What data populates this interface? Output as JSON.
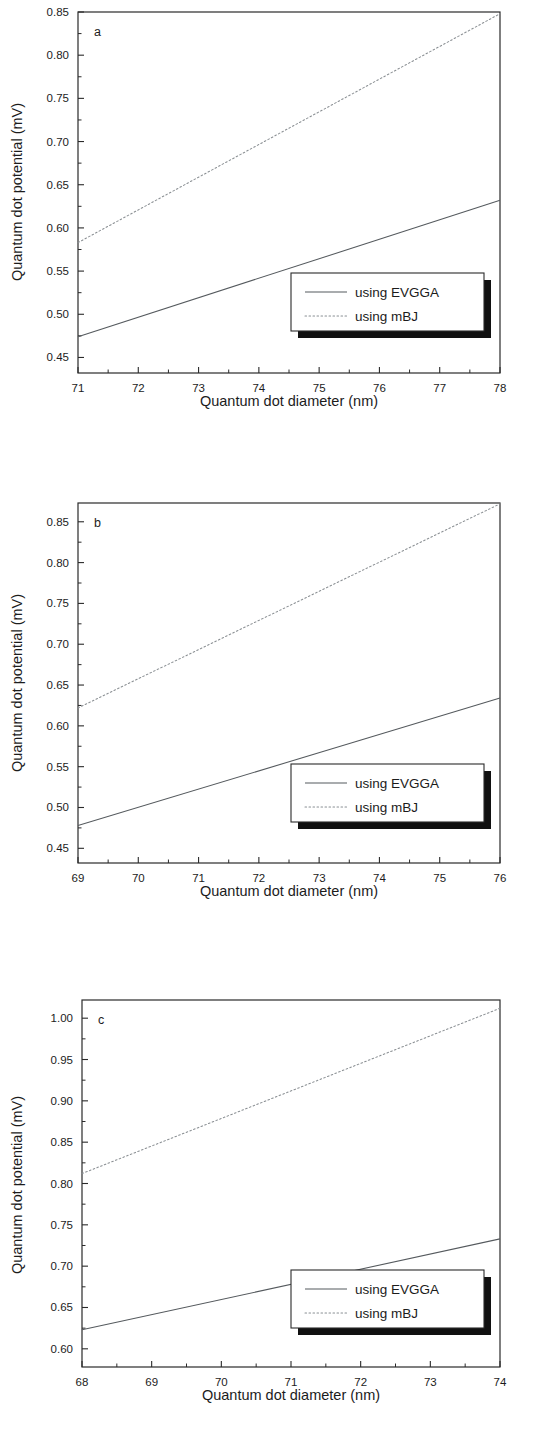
{
  "figure": {
    "panels": [
      "a",
      "b",
      "c"
    ],
    "shared_xlabel": "Quantum dot diameter (nm)",
    "shared_ylabel": "Quantum dot potential (mV)",
    "legend_entries": [
      "using EVGGA",
      "using mBJ"
    ]
  },
  "chart_data": [
    {
      "type": "line",
      "panel_label": "a",
      "title": "",
      "xlabel": "Quantum dot diameter (nm)",
      "ylabel": "Quantum dot potential (mV)",
      "xlim": [
        71,
        78
      ],
      "ylim": [
        0.432,
        0.85
      ],
      "xticks": [
        71,
        72,
        73,
        74,
        75,
        76,
        77,
        78
      ],
      "xtick_labels": [
        "71",
        "72",
        "73",
        "74",
        "75",
        "76",
        "77",
        "78"
      ],
      "yticks": [
        0.45,
        0.5,
        0.55,
        0.6,
        0.65,
        0.7,
        0.75,
        0.8,
        0.85
      ],
      "ytick_labels": [
        "0.45",
        "0.50",
        "0.55",
        "0.60",
        "0.65",
        "0.70",
        "0.75",
        "0.80",
        "0.85"
      ],
      "grid": false,
      "legend_position": "lower right",
      "series": [
        {
          "name": "using EVGGA",
          "style": "solid",
          "color": "#555a5e",
          "x": [
            71,
            78
          ],
          "values": [
            0.474,
            0.632
          ]
        },
        {
          "name": "using mBJ",
          "style": "dotted",
          "color": "#8a8f93",
          "x": [
            71,
            78
          ],
          "values": [
            0.583,
            0.848
          ]
        }
      ]
    },
    {
      "type": "line",
      "panel_label": "b",
      "title": "",
      "xlabel": "Quantum dot diameter (nm)",
      "ylabel": "Quantum dot potential (mV)",
      "xlim": [
        69,
        76
      ],
      "ylim": [
        0.432,
        0.873
      ],
      "xticks": [
        69,
        70,
        71,
        72,
        73,
        74,
        75,
        76
      ],
      "xtick_labels": [
        "69",
        "70",
        "71",
        "72",
        "73",
        "74",
        "75",
        "76"
      ],
      "yticks": [
        0.45,
        0.5,
        0.55,
        0.6,
        0.65,
        0.7,
        0.75,
        0.8,
        0.85
      ],
      "ytick_labels": [
        "0.45",
        "0.50",
        "0.55",
        "0.60",
        "0.65",
        "0.70",
        "0.75",
        "0.80",
        "0.85"
      ],
      "grid": false,
      "legend_position": "lower right",
      "series": [
        {
          "name": "using EVGGA",
          "style": "solid",
          "color": "#555a5e",
          "x": [
            69,
            76
          ],
          "values": [
            0.478,
            0.634
          ]
        },
        {
          "name": "using mBJ",
          "style": "dotted",
          "color": "#8a8f93",
          "x": [
            69,
            76
          ],
          "values": [
            0.622,
            0.872
          ]
        }
      ]
    },
    {
      "type": "line",
      "panel_label": "c",
      "title": "",
      "xlabel": "Quantum dot diameter (nm)",
      "ylabel": "Quantum dot potential (mV)",
      "xlim": [
        68,
        74
      ],
      "ylim": [
        0.578,
        1.022
      ],
      "xticks": [
        68,
        69,
        70,
        71,
        72,
        73,
        74
      ],
      "xtick_labels": [
        "68",
        "69",
        "70",
        "71",
        "72",
        "73",
        "74"
      ],
      "yticks": [
        0.6,
        0.65,
        0.7,
        0.75,
        0.8,
        0.85,
        0.9,
        0.95,
        1.0
      ],
      "ytick_labels": [
        "0.60",
        "0.65",
        "0.70",
        "0.75",
        "0.80",
        "0.85",
        "0.90",
        "0.95",
        "1.00"
      ],
      "grid": false,
      "legend_position": "lower right",
      "series": [
        {
          "name": "using EVGGA",
          "style": "solid",
          "color": "#555a5e",
          "x": [
            68,
            74
          ],
          "values": [
            0.623,
            0.733
          ]
        },
        {
          "name": "using mBJ",
          "style": "dotted",
          "color": "#8a8f93",
          "x": [
            68,
            74
          ],
          "values": [
            0.812,
            1.012
          ]
        }
      ]
    }
  ]
}
